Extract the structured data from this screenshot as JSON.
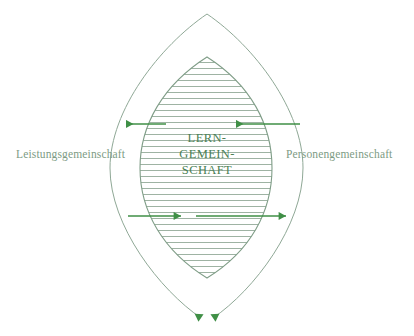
{
  "figure": {
    "type": "venn-lens-diagram",
    "background_color": "#ffffff",
    "outline_color": "#8fa896",
    "hatch_color": "#93ab99",
    "arrow_color": "#3f8f46",
    "label_color": "#7d9b84",
    "center_text_color": "#4b7f55"
  },
  "labels": {
    "left": "Leistungsgemeinschaft",
    "right": "Personengemeinschaft",
    "center_lines": [
      "LERN-",
      "GEMEIN-",
      "SCHAFT"
    ]
  },
  "shapes": {
    "outer_lens_name": "outer-lens",
    "inner_lens_name": "inner-lens-hatched"
  },
  "arrows": [
    {
      "name": "arrow-upper-outer-left",
      "direction": "left",
      "row": "upper"
    },
    {
      "name": "arrow-upper-inner-left",
      "direction": "left",
      "row": "upper"
    },
    {
      "name": "arrow-lower-inner-right",
      "direction": "right",
      "row": "lower"
    },
    {
      "name": "arrow-lower-outer-right",
      "direction": "right",
      "row": "lower"
    },
    {
      "name": "arrow-bottom-left-down",
      "direction": "down",
      "row": "bottom"
    },
    {
      "name": "arrow-bottom-right-down",
      "direction": "down",
      "row": "bottom"
    }
  ]
}
